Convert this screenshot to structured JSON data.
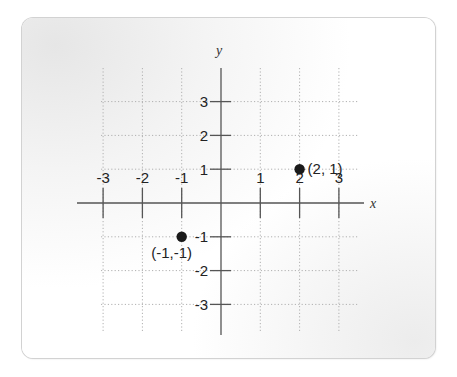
{
  "chart_data": {
    "type": "scatter",
    "title": "",
    "xlabel": "x",
    "ylabel": "y",
    "xlim": [
      -3.5,
      3.5
    ],
    "ylim": [
      -3.5,
      3.5
    ],
    "grid": true,
    "grid_style": "dotted",
    "x_ticks": [
      -3,
      -2,
      -1,
      1,
      2,
      3
    ],
    "x_tick_labels": [
      "-3",
      "-2",
      "-1",
      "1",
      "2",
      "3"
    ],
    "y_ticks": [
      3,
      2,
      1,
      -1,
      -2,
      -3
    ],
    "y_tick_labels": [
      "3",
      "2",
      "1",
      "-1",
      "-2",
      "-3"
    ],
    "points": [
      {
        "x": 2,
        "y": 1,
        "label": "(2, 1)"
      },
      {
        "x": -1,
        "y": -1,
        "label": "(-1,-1)"
      }
    ],
    "legend": null,
    "colors": {
      "axis": "#555555",
      "grid": "#b0b0b0",
      "point": "#1a1a1a",
      "text": "#222222"
    }
  }
}
